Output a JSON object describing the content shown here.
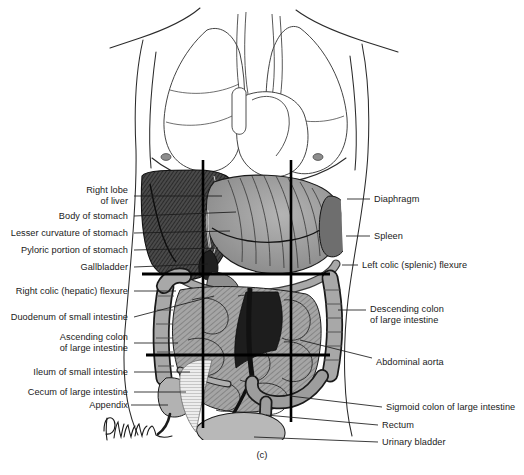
{
  "figure": {
    "caption": "(c)",
    "caption_x": 262,
    "caption_y": 455,
    "artist_signature": "Dahmann",
    "view_title": "Anterior view of thoracic and abdominal viscera in situ",
    "line_color": "#1a1a1a",
    "text_color": "#1a1a1a",
    "background": "#ffffff"
  },
  "labels_left": [
    {
      "id": "right-lobe-of-liver",
      "lines": [
        "Right lobe",
        "of liver"
      ],
      "text_right_x": 128,
      "text_y": 196,
      "leader_from_x": 134,
      "leader_from_y": 196,
      "leader_to_x": 222,
      "leader_to_y": 196
    },
    {
      "id": "body-of-stomach",
      "lines": [
        "Body of stomach"
      ],
      "text_right_x": 128,
      "text_y": 216,
      "leader_from_x": 134,
      "leader_from_y": 216,
      "leader_to_x": 236,
      "leader_to_y": 212
    },
    {
      "id": "lesser-curvature-of-stomach",
      "lines": [
        "Lesser curvature of stomach"
      ],
      "text_right_x": 128,
      "text_y": 233,
      "leader_from_x": 134,
      "leader_from_y": 233,
      "leader_to_x": 230,
      "leader_to_y": 231
    },
    {
      "id": "pyloric-portion-of-stomach",
      "lines": [
        "Pyloric portion of stomach"
      ],
      "text_right_x": 128,
      "text_y": 250,
      "leader_from_x": 134,
      "leader_from_y": 250,
      "leader_to_x": 218,
      "leader_to_y": 248
    },
    {
      "id": "gallbladder",
      "lines": [
        "Gallbladder"
      ],
      "text_right_x": 128,
      "text_y": 267,
      "leader_from_x": 134,
      "leader_from_y": 267,
      "leader_to_x": 208,
      "leader_to_y": 264
    },
    {
      "id": "right-colic-hepatic-flexure",
      "lines": [
        "Right colic (hepatic) flexure"
      ],
      "text_right_x": 128,
      "text_y": 291,
      "leader_from_x": 134,
      "leader_from_y": 291,
      "leader_to_x": 176,
      "leader_to_y": 291
    },
    {
      "id": "duodenum-of-small-intestine",
      "lines": [
        "Duodenum of small intestine"
      ],
      "text_right_x": 128,
      "text_y": 317,
      "leader_from_x": 134,
      "leader_from_y": 317,
      "leader_to_x": 214,
      "leader_to_y": 296
    },
    {
      "id": "ascending-colon-of-large-intestine",
      "lines": [
        "Ascending colon",
        "of large intestine"
      ],
      "text_right_x": 128,
      "text_y": 343,
      "leader_from_x": 134,
      "leader_from_y": 343,
      "leader_to_x": 178,
      "leader_to_y": 343
    },
    {
      "id": "ileum-of-small-intestine",
      "lines": [
        "Ileum of small intestine"
      ],
      "text_right_x": 128,
      "text_y": 372,
      "leader_from_x": 134,
      "leader_from_y": 372,
      "leader_to_x": 190,
      "leader_to_y": 372
    },
    {
      "id": "cecum-of-large-intestine",
      "lines": [
        "Cecum of large intestine"
      ],
      "text_right_x": 128,
      "text_y": 392,
      "leader_from_x": 134,
      "leader_from_y": 392,
      "leader_to_x": 186,
      "leader_to_y": 392
    },
    {
      "id": "appendix",
      "lines": [
        "Appendix"
      ],
      "text_right_x": 128,
      "text_y": 405,
      "leader_from_x": 131,
      "leader_from_y": 405,
      "leader_to_x": 168,
      "leader_to_y": 405
    }
  ],
  "labels_right": [
    {
      "id": "diaphragm",
      "lines": [
        "Diaphragm"
      ],
      "text_left_x": 374,
      "text_y": 199,
      "leader_from_x": 370,
      "leader_from_y": 199,
      "leader_to_x": 347,
      "leader_to_y": 199
    },
    {
      "id": "spleen",
      "lines": [
        "Spleen"
      ],
      "text_left_x": 374,
      "text_y": 236,
      "leader_from_x": 370,
      "leader_from_y": 236,
      "leader_to_x": 346,
      "leader_to_y": 236
    },
    {
      "id": "left-colic-splenic-flexure",
      "lines": [
        "Left colic (splenic) flexure"
      ],
      "text_left_x": 362,
      "text_y": 265,
      "leader_from_x": 358,
      "leader_from_y": 265,
      "leader_to_x": 342,
      "leader_to_y": 265
    },
    {
      "id": "descending-colon-of-large-intestine",
      "lines": [
        "Descending colon",
        "of large intestine"
      ],
      "text_left_x": 370,
      "text_y": 315,
      "leader_from_x": 366,
      "leader_from_y": 310,
      "leader_to_x": 338,
      "leader_to_y": 310
    },
    {
      "id": "abdominal-aorta",
      "lines": [
        "Abdominal aorta"
      ],
      "text_left_x": 376,
      "text_y": 362,
      "leader_from_x": 372,
      "leader_from_y": 358,
      "leader_to_x": 300,
      "leader_to_y": 340
    },
    {
      "id": "sigmoid-colon-of-large-intestine",
      "lines": [
        "Sigmoid colon of large intestine"
      ],
      "text_left_x": 386,
      "text_y": 407,
      "leader_from_x": 382,
      "leader_from_y": 407,
      "leader_to_x": 290,
      "leader_to_y": 396
    },
    {
      "id": "rectum",
      "lines": [
        "Rectum"
      ],
      "text_left_x": 382,
      "text_y": 425,
      "leader_from_x": 378,
      "leader_from_y": 425,
      "leader_to_x": 266,
      "leader_to_y": 415
    },
    {
      "id": "urinary-bladder",
      "lines": [
        "Urinary bladder"
      ],
      "text_left_x": 382,
      "text_y": 442,
      "leader_from_x": 378,
      "leader_from_y": 442,
      "leader_to_x": 254,
      "leader_to_y": 437
    }
  ],
  "reference_lines": {
    "vertical": [
      {
        "id": "midclavicular-right",
        "x": 203,
        "y1": 160,
        "y2": 428
      },
      {
        "id": "midclavicular-left",
        "x": 291,
        "y1": 160,
        "y2": 422
      }
    ],
    "horizontal": [
      {
        "id": "transpyloric-plane",
        "x1": 142,
        "x2": 330,
        "y": 274
      },
      {
        "id": "transtubercular-plane",
        "x1": 146,
        "x2": 330,
        "y": 355
      }
    ]
  }
}
